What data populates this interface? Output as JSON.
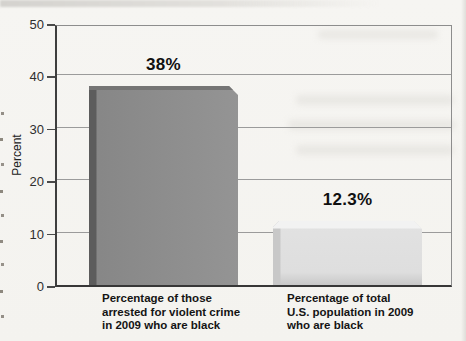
{
  "figure": {
    "kind": "scanned textbook bar chart",
    "background": "#f5f4f1"
  },
  "chart_data": {
    "type": "bar",
    "title": "",
    "xlabel": "",
    "ylabel": "Percent",
    "ylim": [
      0,
      50
    ],
    "yticks": [
      0,
      10,
      20,
      30,
      40,
      50
    ],
    "grid": true,
    "legend": null,
    "categories": [
      "Percentage of those arrested for violent crime in 2009 who are black",
      "Percentage of total U.S. population in 2009 who are black"
    ],
    "values": [
      38,
      12.3
    ],
    "bars": [
      {
        "label_lines": [
          "Percentage of those",
          "arrested for violent crime",
          "in 2009 who are black"
        ],
        "value": 38,
        "value_label": "38%",
        "style": "dark",
        "fill": "#8e8e8e"
      },
      {
        "label_lines": [
          "Percentage of total",
          "U.S. population in 2009",
          "who are black"
        ],
        "value": 12.3,
        "value_label": "12.3%",
        "style": "light",
        "fill": "#e0e0e0"
      }
    ]
  }
}
